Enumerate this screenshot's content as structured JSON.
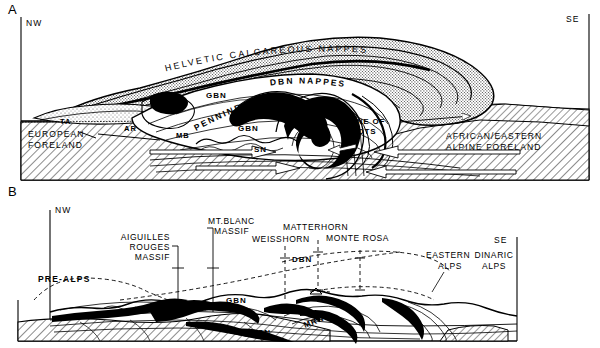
{
  "figure": {
    "type": "geological-cross-section",
    "panels": [
      {
        "id": "A",
        "direction_left": "NW",
        "direction_right": "SE",
        "arc_labels": [
          {
            "text": "HELVETIC  CALCAREOUS  NAPPES"
          },
          {
            "text": "DBN NAPPES"
          },
          {
            "text": "PENNINE"
          }
        ],
        "region_labels": [
          {
            "text": "EUROPEAN",
            "sub": "FORELAND"
          },
          {
            "text": "AFRICAN/EASTERN",
            "sub": "ALPINE FORELAND"
          },
          {
            "text": "ZONE OF",
            "sub": "ROOTS"
          }
        ],
        "unit_labels": [
          "TA",
          "AR",
          "MB",
          "GBN",
          "GBN",
          "SN",
          "MRN"
        ]
      },
      {
        "id": "B",
        "direction_left": "NW",
        "direction_right": "SE",
        "peak_labels": [
          {
            "text": "AIGUILLES",
            "line2": "ROUGES",
            "line3": "MASSIF"
          },
          {
            "text": "MT.BLANC",
            "line2": "MASSIF"
          },
          {
            "text": "MATTERHORN"
          },
          {
            "text": "WEISSHORN"
          },
          {
            "text": "MONTE ROSA"
          },
          {
            "text": "EASTERN",
            "line2": "ALPS"
          },
          {
            "text": "DINARIC",
            "line2": "ALPS"
          }
        ],
        "region_labels": [
          "PRE-ALPS"
        ],
        "unit_labels": [
          "GBN",
          "DBN",
          "SN",
          "MRN"
        ]
      }
    ],
    "colors": {
      "ink": "#000000",
      "paper": "#ffffff",
      "stipple": "#4a4a4a",
      "hatch": "#000000"
    }
  }
}
